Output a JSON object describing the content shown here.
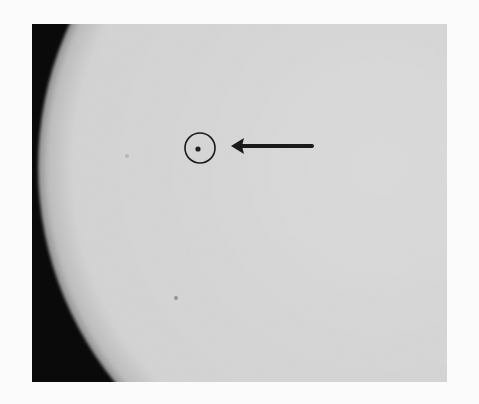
{
  "image": {
    "subject": "Photograph of the solar disk limb with a sunspot circled and indicated by an arrow",
    "colors": {
      "page_background": "#fbfbfb",
      "sky": "#0a0a0a",
      "solar_disk": "#d6d6d6",
      "annotation": "#1a1a1a"
    },
    "photo_frame": {
      "x": 32,
      "y": 24,
      "width": 415,
      "height": 358
    },
    "solar_limb": {
      "cx": 346,
      "cy": 143,
      "r": 340
    },
    "sunspot": {
      "x": 166,
      "y": 125,
      "r": 2.5
    },
    "marker_circle": {
      "x": 168,
      "y": 124,
      "r": 15
    },
    "arrow": {
      "tip_x": 199,
      "tail_x": 280,
      "y": 122
    },
    "faint_spots": [
      {
        "x": 144,
        "y": 274,
        "r": 2
      },
      {
        "x": 95,
        "y": 132,
        "r": 2
      }
    ]
  }
}
